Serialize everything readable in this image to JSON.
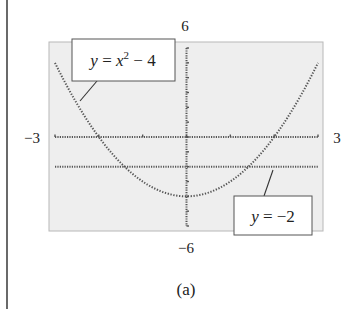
{
  "chart_data": {
    "type": "line",
    "title": "",
    "caption": "(a)",
    "xlabel": "",
    "ylabel": "",
    "xlim": [
      -3,
      3
    ],
    "ylim": [
      -6,
      6
    ],
    "tick_labels": {
      "xmin": "−3",
      "xmax": "3",
      "ymax": "6",
      "ymin": "−6"
    },
    "x_ticks": [
      -3,
      -2,
      -1,
      0,
      1,
      2,
      3
    ],
    "y_ticks": [
      -6,
      -5,
      -4,
      -3,
      -2,
      -1,
      0,
      1,
      2,
      3,
      4,
      5,
      6
    ],
    "grid": false,
    "series": [
      {
        "name": "y = x² − 4",
        "expression": "x^2 - 4",
        "style": "dotted",
        "x": [
          -3,
          -2.5,
          -2,
          -1.5,
          -1,
          -0.5,
          0,
          0.5,
          1,
          1.5,
          2,
          2.5,
          3
        ],
        "values": [
          5,
          2.25,
          0,
          -1.75,
          -3,
          -3.75,
          -4,
          -3.75,
          -3,
          -1.75,
          0,
          2.25,
          5
        ]
      },
      {
        "name": "y = −2",
        "expression": "-2",
        "style": "dotted",
        "x": [
          -3,
          3
        ],
        "values": [
          -2,
          -2
        ]
      }
    ],
    "annotations": [
      {
        "text_main": "y = x",
        "superscript": "2",
        "text_tail": " − 4",
        "points_to": "parabola"
      },
      {
        "text_main": "y = −2",
        "points_to": "horizontal line"
      }
    ]
  },
  "labels": {
    "ymax": "6",
    "ymin": "−6",
    "xmin": "−3",
    "xmax": "3",
    "caption": "(a)",
    "callout1_a": "y",
    "callout1_b": " = ",
    "callout1_c": "x",
    "callout1_sup": "2",
    "callout1_d": " − 4",
    "callout2_a": "y",
    "callout2_b": " = −2"
  },
  "colors": {
    "plot_bg": "#eeeeee",
    "plot_border": "#b8b8b8",
    "curve": "#555555",
    "axis": "#555555",
    "frame_line": "#444444"
  }
}
